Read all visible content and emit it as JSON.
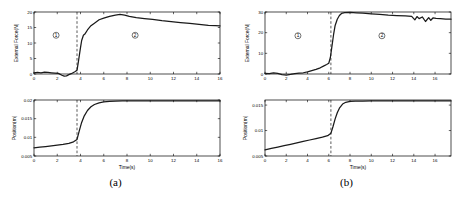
{
  "figure": {
    "panels": [
      {
        "id": "a",
        "caption": "(a)",
        "force_plot": {
          "ylabel": "External Force(N)",
          "xlabel": "",
          "yticks": [
            0,
            5,
            10,
            15,
            20
          ],
          "xticks": [
            0,
            2,
            4,
            6,
            8,
            10,
            12,
            14,
            16
          ],
          "ylim": [
            0,
            20
          ],
          "xlim": [
            0,
            16
          ],
          "transition_time": 3.7,
          "region_labels": [
            {
              "text": "①",
              "x": 1.9,
              "y": 12.5
            },
            {
              "text": "②",
              "x": 8.7,
              "y": 12.5
            }
          ]
        },
        "position_plot": {
          "ylabel": "Position(m)",
          "xlabel": "Time(s)",
          "yticks": [
            0.005,
            0.01,
            0.015,
            0.02
          ],
          "ytick_labels": [
            "0.005",
            "0.01",
            "0.015",
            "0.02"
          ],
          "xticks": [
            0,
            2,
            4,
            6,
            8,
            10,
            12,
            14,
            16
          ],
          "ylim": [
            0.005,
            0.02
          ],
          "xlim": [
            0,
            16
          ],
          "transition_time": 3.7
        }
      },
      {
        "id": "b",
        "caption": "(b)",
        "force_plot": {
          "ylabel": "External Force(N)",
          "xlabel": "",
          "yticks": [
            0,
            10,
            20,
            30
          ],
          "xticks": [
            0,
            2,
            4,
            6,
            8,
            10,
            12,
            14,
            16
          ],
          "ylim": [
            0,
            30
          ],
          "xlim": [
            0,
            17.5
          ],
          "transition_time": 6.2,
          "region_labels": [
            {
              "text": "①",
              "x": 3.1,
              "y": 18.5
            },
            {
              "text": "②",
              "x": 11.0,
              "y": 18.5
            }
          ]
        },
        "position_plot": {
          "ylabel": "Position(m)",
          "xlabel": "Time(s)",
          "yticks": [
            0.005,
            0.01,
            0.015
          ],
          "ytick_labels": [
            "0.005",
            "0.01",
            "0.015"
          ],
          "xticks": [
            0,
            2,
            4,
            6,
            8,
            10,
            12,
            14,
            16
          ],
          "ylim": [
            0.005,
            0.016
          ],
          "xlim": [
            0,
            17.5
          ],
          "transition_time": 6.2
        }
      }
    ]
  },
  "chart_data": [
    {
      "type": "line",
      "panel": "a",
      "subplot": "force",
      "title": "",
      "xlabel": "",
      "ylabel": "External Force(N)",
      "xlim": [
        0,
        16
      ],
      "ylim": [
        0,
        20
      ],
      "xticks": [
        0,
        2,
        4,
        6,
        8,
        10,
        12,
        14,
        16
      ],
      "yticks": [
        0,
        5,
        10,
        15,
        20
      ],
      "grid": false,
      "legend": null,
      "annotations": [
        "① region 1 (free motion)",
        "② region 2 (contact)"
      ],
      "event_marker_x": 3.7,
      "x": [
        0,
        0.3,
        0.6,
        0.9,
        1.2,
        1.5,
        1.8,
        2.1,
        2.4,
        2.6,
        2.8,
        3.0,
        3.2,
        3.4,
        3.55,
        3.7,
        3.8,
        3.9,
        4.0,
        4.1,
        4.25,
        4.4,
        4.6,
        4.9,
        5.2,
        5.6,
        6.0,
        6.5,
        7.0,
        7.4,
        7.8,
        8.2,
        8.8,
        9.5,
        10.2,
        11.0,
        11.8,
        12.6,
        13.4,
        14.2,
        15.0,
        15.6,
        16.0
      ],
      "y": [
        0.4,
        0.5,
        0.4,
        0.6,
        0.5,
        0.4,
        0.3,
        0.2,
        -0.4,
        -0.7,
        -0.6,
        -0.2,
        0.1,
        0.5,
        0.8,
        1.2,
        3.5,
        6.0,
        8.5,
        10.8,
        12.5,
        13.0,
        14.2,
        15.6,
        16.4,
        17.5,
        18.0,
        18.6,
        19.0,
        19.2,
        19.0,
        18.6,
        18.2,
        17.9,
        17.6,
        17.2,
        16.9,
        16.6,
        16.3,
        16.0,
        15.7,
        15.6,
        15.5
      ]
    },
    {
      "type": "line",
      "panel": "a",
      "subplot": "position",
      "title": "",
      "xlabel": "Time(s)",
      "ylabel": "Position(m)",
      "xlim": [
        0,
        16
      ],
      "ylim": [
        0.005,
        0.02
      ],
      "xticks": [
        0,
        2,
        4,
        6,
        8,
        10,
        12,
        14,
        16
      ],
      "yticks": [
        0.005,
        0.01,
        0.015,
        0.02
      ],
      "grid": false,
      "legend": null,
      "event_marker_x": 3.7,
      "x": [
        0,
        0.5,
        1.0,
        1.5,
        2.0,
        2.5,
        3.0,
        3.4,
        3.7,
        3.9,
        4.1,
        4.3,
        4.6,
        4.9,
        5.2,
        5.6,
        6.0,
        6.5,
        7.0,
        7.6,
        8.2,
        9.0,
        10.0,
        11.0,
        12.0,
        13.0,
        14.0,
        15.0,
        16.0
      ],
      "y": [
        0.0072,
        0.00735,
        0.00752,
        0.0077,
        0.0079,
        0.00812,
        0.0084,
        0.0088,
        0.00945,
        0.0118,
        0.014,
        0.0156,
        0.0172,
        0.0182,
        0.0188,
        0.01925,
        0.0195,
        0.01965,
        0.01972,
        0.01976,
        0.01978,
        0.01979,
        0.0198,
        0.0198,
        0.0198,
        0.0198,
        0.0198,
        0.0198,
        0.0198
      ]
    },
    {
      "type": "line",
      "panel": "b",
      "subplot": "force",
      "title": "",
      "xlabel": "",
      "ylabel": "External Force(N)",
      "xlim": [
        0,
        17.5
      ],
      "ylim": [
        0,
        30
      ],
      "xticks": [
        0,
        2,
        4,
        6,
        8,
        10,
        12,
        14,
        16
      ],
      "yticks": [
        0,
        10,
        20,
        30
      ],
      "grid": false,
      "legend": null,
      "annotations": [
        "① region 1 (free motion)",
        "② region 2 (contact)"
      ],
      "event_marker_x": 6.2,
      "x": [
        0,
        0.4,
        0.8,
        1.2,
        1.6,
        2.0,
        2.4,
        2.8,
        3.2,
        3.6,
        4.0,
        4.4,
        4.8,
        5.2,
        5.5,
        5.8,
        6.0,
        6.15,
        6.3,
        6.45,
        6.6,
        6.8,
        7.0,
        7.2,
        7.5,
        8.0,
        8.6,
        9.2,
        10.0,
        10.8,
        11.6,
        12.4,
        13.2,
        13.8,
        14.1,
        14.3,
        14.5,
        14.8,
        15.1,
        15.4,
        15.6,
        15.8,
        16.1,
        16.5,
        17.0,
        17.5
      ],
      "y": [
        0.3,
        0.2,
        0.5,
        0.3,
        -0.3,
        -0.5,
        -0.2,
        0.2,
        0.4,
        0.6,
        1.0,
        1.6,
        2.2,
        3.0,
        3.8,
        4.6,
        5.2,
        8.0,
        13.5,
        19.0,
        23.5,
        26.5,
        28.3,
        29.3,
        29.7,
        29.8,
        29.6,
        29.4,
        29.1,
        28.8,
        28.5,
        28.3,
        28.1,
        27.9,
        26.2,
        27.8,
        26.8,
        27.6,
        25.4,
        27.3,
        26.0,
        27.1,
        26.9,
        26.8,
        26.6,
        26.5
      ]
    },
    {
      "type": "line",
      "panel": "b",
      "subplot": "position",
      "title": "",
      "xlabel": "Time(s)",
      "ylabel": "Position(m)",
      "xlim": [
        0,
        17.5
      ],
      "ylim": [
        0.005,
        0.016
      ],
      "xticks": [
        0,
        2,
        4,
        6,
        8,
        10,
        12,
        14,
        16
      ],
      "yticks": [
        0.005,
        0.01,
        0.015
      ],
      "grid": false,
      "legend": null,
      "event_marker_x": 6.2,
      "x": [
        0,
        0.6,
        1.2,
        1.8,
        2.4,
        3.0,
        3.6,
        4.2,
        4.8,
        5.4,
        5.9,
        6.2,
        6.4,
        6.6,
        6.8,
        7.0,
        7.3,
        7.6,
        8.0,
        8.5,
        9.2,
        10.0,
        11.0,
        12.0,
        13.0,
        14.0,
        15.0,
        16.0,
        17.0,
        17.5
      ],
      "y": [
        0.0062,
        0.00648,
        0.00675,
        0.00702,
        0.0073,
        0.00758,
        0.00786,
        0.00814,
        0.00842,
        0.00872,
        0.009,
        0.00945,
        0.0108,
        0.0123,
        0.0135,
        0.0144,
        0.0152,
        0.01555,
        0.01572,
        0.01578,
        0.0158,
        0.01581,
        0.01581,
        0.01581,
        0.01581,
        0.01581,
        0.01581,
        0.01581,
        0.01581,
        0.01581
      ]
    }
  ]
}
